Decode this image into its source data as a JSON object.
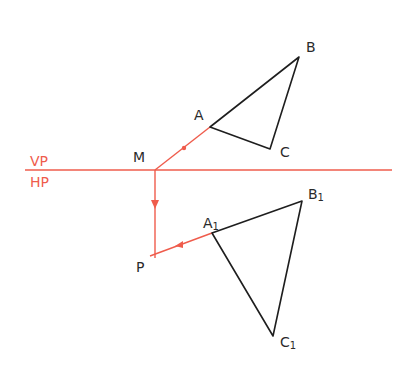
{
  "diagram": {
    "colors": {
      "construction": "#ef5c4c",
      "object": "#1e1e1e",
      "background": "#ffffff"
    },
    "reference_line": {
      "upper_label": "VP",
      "lower_label": "HP"
    },
    "points": {
      "M": "M",
      "P": "P",
      "A": "A",
      "B": "B",
      "C": "C",
      "A1": "A",
      "A1_sub": "1",
      "B1": "B",
      "B1_sub": "1",
      "C1": "C",
      "C1_sub": "1"
    }
  }
}
